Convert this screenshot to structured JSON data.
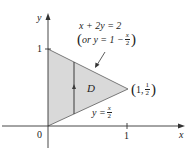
{
  "diagram": {
    "type": "region-plot",
    "colors": {
      "region_fill": "#d9d9d9",
      "line": "#4a4a4a",
      "axis": "#333333",
      "text": "#222222"
    },
    "axes": {
      "x_label": "x",
      "y_label": "y",
      "origin_label": "0",
      "x_tick_label": "1",
      "y_tick_label": "1"
    },
    "region": {
      "label": "D",
      "vertices": [
        [
          0,
          0
        ],
        [
          0,
          1
        ],
        [
          1,
          0.5
        ]
      ]
    },
    "upper_boundary": {
      "equation": "x + 2y = 2",
      "alt_prefix": "or y = 1 −",
      "alt_frac_num": "x",
      "alt_frac_den": "2"
    },
    "lower_boundary": {
      "lhs": "y =",
      "frac_num": "x",
      "frac_den": "2"
    },
    "vertex_point": {
      "open": "(",
      "x": "1,",
      "frac_num": "1",
      "frac_den": "2",
      "close": ")"
    }
  }
}
